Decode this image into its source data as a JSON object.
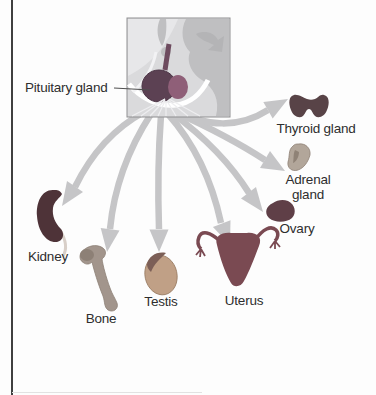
{
  "labels": {
    "pituitary": "Pituitary gland",
    "thyroid": "Thyroid gland",
    "adrenal_line1": "Adrenal",
    "adrenal_line2": "gland",
    "ovary": "Ovary",
    "kidney": "Kidney",
    "bone": "Bone",
    "testis": "Testis",
    "uterus": "Uterus"
  },
  "colors": {
    "arrow_gray": "#c5c5c7",
    "label_text": "#2e2e2e",
    "inset_bg": "#dadadc",
    "inset_midgray": "#bfbfc1",
    "pituitary_anterior": "#5c4153",
    "pituitary_posterior": "#8f5f78",
    "kidney_maroon": "#4e3338",
    "thyroid_maroon": "#584347",
    "ovary_maroon": "#5f3f47",
    "uterus_maroon": "#7a4a52",
    "bone_tan": "#a2958c",
    "testis_tan": "#c0a086",
    "adrenal_tan": "#b2a69a"
  }
}
